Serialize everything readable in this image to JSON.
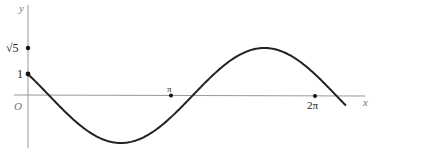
{
  "chart_data": {
    "type": "line",
    "title": "",
    "function": "y = cos x - 2 sin x",
    "xlabel": "x",
    "ylabel": "y",
    "origin_label": "O",
    "x_ticks": [
      {
        "value": 3.14159,
        "label": "π"
      },
      {
        "value": 6.28318,
        "label": "2π"
      }
    ],
    "y_ticks": [
      {
        "value": 1,
        "label": "1"
      },
      {
        "value": 2.236,
        "label": "√5"
      }
    ],
    "xlim": [
      0,
      7.0
    ],
    "ylim": [
      -2.236,
      2.236
    ],
    "grid": false,
    "legend": null,
    "key_points": [
      {
        "x": 0,
        "y": 1
      },
      {
        "x": 2.034,
        "y": -2.236
      },
      {
        "x": 5.176,
        "y": 2.236
      }
    ],
    "colors": {
      "curve": "#222222",
      "axis": "#999999"
    }
  },
  "labels": {
    "y_axis": "y",
    "x_axis": "x",
    "origin": "O",
    "sqrt5": "√5",
    "one": "1",
    "pi": "π",
    "two_pi": "2π"
  }
}
